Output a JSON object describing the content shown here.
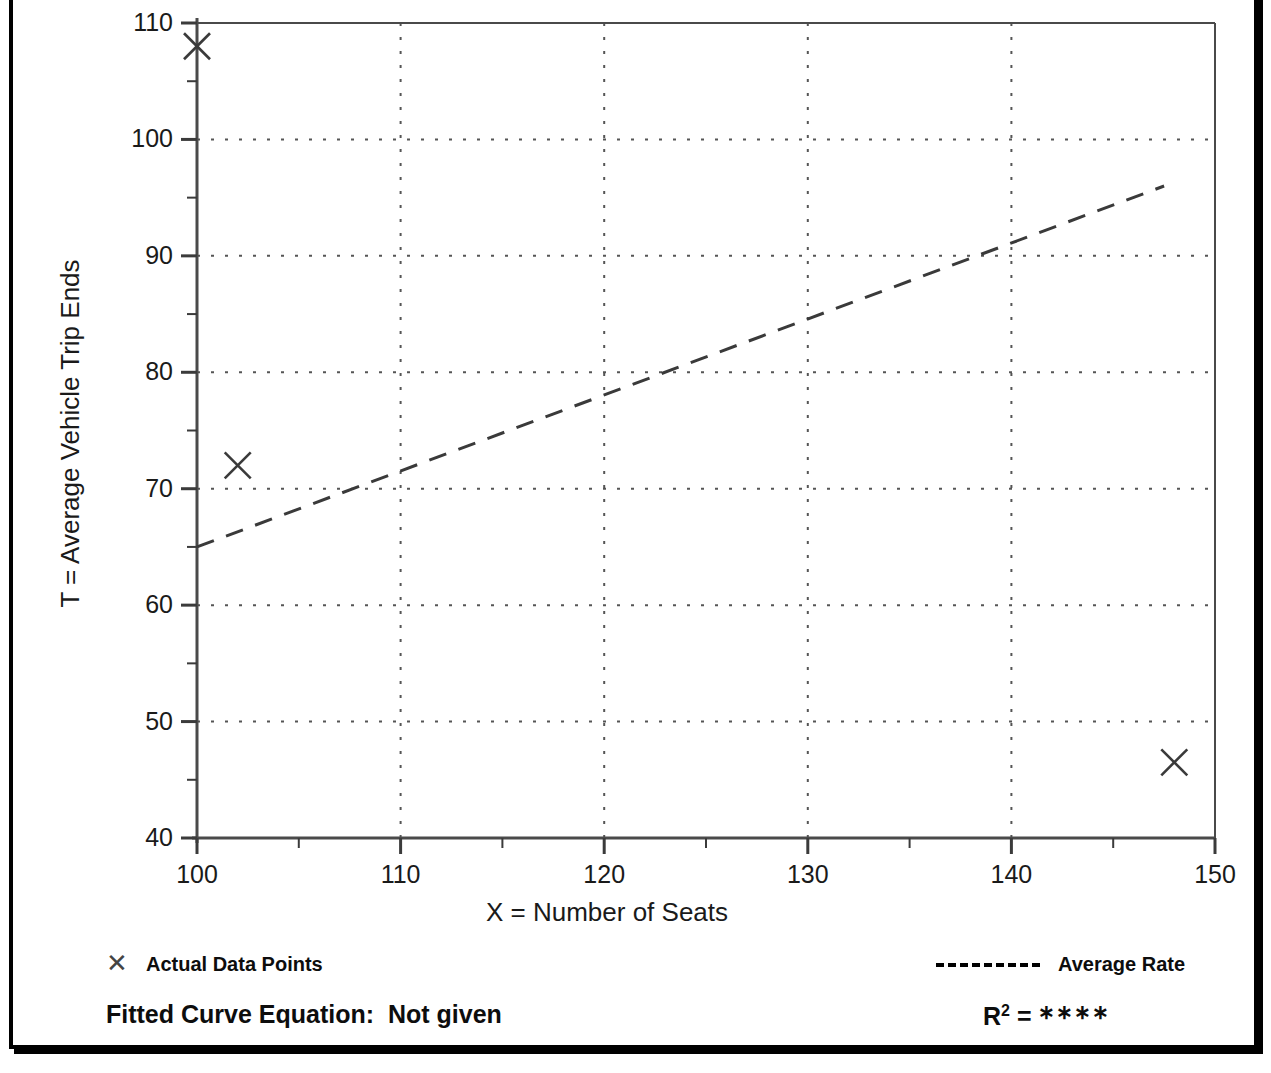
{
  "chart_data": {
    "type": "scatter",
    "title": "",
    "xlabel": "X = Number of Seats",
    "ylabel": "T = Average Vehicle Trip Ends",
    "xlim": [
      100,
      150
    ],
    "ylim": [
      40,
      110
    ],
    "xticks": [
      "100",
      "110",
      "120",
      "130",
      "140",
      "150"
    ],
    "xtick_values": [
      100,
      110,
      120,
      130,
      140,
      150
    ],
    "yticks": [
      "40",
      "50",
      "60",
      "70",
      "80",
      "90",
      "100",
      "110"
    ],
    "ytick_values": [
      40,
      50,
      60,
      70,
      80,
      90,
      100,
      110
    ],
    "x_minor_interval": 5,
    "y_minor_interval": 5,
    "grid": "dotted",
    "legend_position": "below-plot",
    "series": [
      {
        "name": "Actual Data Points",
        "type": "scatter",
        "marker": "x",
        "points": [
          {
            "x": 100,
            "y": 108
          },
          {
            "x": 102,
            "y": 72
          },
          {
            "x": 148,
            "y": 46.5
          }
        ]
      },
      {
        "name": "Average Rate",
        "type": "line",
        "style": "dashed",
        "points": [
          {
            "x": 100,
            "y": 65
          },
          {
            "x": 147.5,
            "y": 96
          }
        ]
      }
    ]
  },
  "axes": {
    "y_title": "T = Average Vehicle Trip Ends",
    "x_title": "X = Number of Seats",
    "y_tick_labels": [
      "110",
      "100",
      "90",
      "80",
      "70",
      "60",
      "50",
      "40"
    ],
    "x_tick_labels": [
      "100",
      "110",
      "120",
      "130",
      "140",
      "150"
    ]
  },
  "legend": {
    "points_marker": "✕",
    "points_label": "Actual Data Points",
    "rate_label": "Average Rate"
  },
  "footer": {
    "equation_label": "Fitted Curve Equation:",
    "equation_value": "Not given",
    "r2_symbol": "R",
    "r2_exponent": "2",
    "r2_equals": "=",
    "r2_value": "∗∗∗∗"
  },
  "colors": {
    "frame": "#000000",
    "axis": "#3b3b3b",
    "grid": "#555555",
    "marker": "#3a3a3a",
    "trend": "#3a3a3a",
    "text": "#1a1a1a",
    "background": "#ffffff"
  }
}
